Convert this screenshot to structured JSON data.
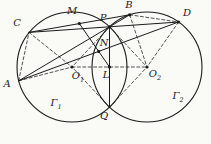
{
  "figure": {
    "colors": {
      "background": "#fafaf7",
      "ink": "#1b1b1b"
    },
    "circles": [
      {
        "id": "gamma1",
        "cx": 72,
        "cy": 67,
        "r": 55,
        "label": "Γ",
        "sub": "1",
        "label_x": 56,
        "label_y": 106
      },
      {
        "id": "gamma2",
        "cx": 147,
        "cy": 67,
        "r": 55,
        "label": "Γ",
        "sub": "2",
        "label_x": 178,
        "label_y": 99
      }
    ],
    "points": {
      "A": {
        "x": 18.7,
        "y": 80.8,
        "label": "A",
        "sub": "",
        "label_x": 7,
        "label_y": 87,
        "dot": false
      },
      "B": {
        "x": 129.7,
        "y": 14.8,
        "label": "B",
        "sub": "",
        "label_x": 129,
        "label_y": 8,
        "dot": true
      },
      "C": {
        "x": 29,
        "y": 32.4,
        "label": "C",
        "sub": "",
        "label_x": 17,
        "label_y": 26,
        "dot": false
      },
      "D": {
        "x": 178.6,
        "y": 22,
        "label": "D",
        "sub": "",
        "label_x": 187,
        "label_y": 16,
        "dot": true
      },
      "P": {
        "x": 109.5,
        "y": 26.8,
        "label": "P",
        "sub": "",
        "label_x": 103,
        "label_y": 21,
        "dot": true
      },
      "Q": {
        "x": 109.5,
        "y": 107.2,
        "label": "Q",
        "sub": "",
        "label_x": 104,
        "label_y": 119,
        "dot": false
      },
      "M": {
        "x": 79.35,
        "y": 23.6,
        "label": "M",
        "sub": "",
        "label_x": 72,
        "label_y": 14,
        "dot": true
      },
      "N": {
        "x": 98.65,
        "y": 51.4,
        "label": "N",
        "sub": "",
        "label_x": 104,
        "label_y": 46,
        "dot": true
      },
      "L": {
        "x": 109.5,
        "y": 67,
        "label": "L",
        "sub": "",
        "label_x": 106,
        "label_y": 78,
        "dot": true
      },
      "O1": {
        "x": 72,
        "y": 67,
        "label": "O",
        "sub": "1",
        "label_x": 78,
        "label_y": 79,
        "dot": true
      },
      "O2": {
        "x": 147,
        "y": 67,
        "label": "O",
        "sub": "2",
        "label_x": 155,
        "label_y": 77,
        "dot": true
      }
    },
    "segments_solid": [
      [
        "A",
        "B"
      ],
      [
        "C",
        "D"
      ],
      [
        "P",
        "Q"
      ],
      [
        "C",
        "B"
      ],
      [
        "A",
        "D"
      ],
      [
        "M",
        "L"
      ]
    ],
    "segments_dashed": [
      [
        "A",
        "C"
      ],
      [
        "B",
        "D"
      ],
      [
        "O1",
        "O2"
      ],
      [
        "P",
        "O1"
      ],
      [
        "P",
        "O2"
      ],
      [
        "Q",
        "O1"
      ],
      [
        "Q",
        "O2"
      ],
      [
        "A",
        "O1"
      ],
      [
        "C",
        "O1"
      ],
      [
        "B",
        "O2"
      ],
      [
        "D",
        "O2"
      ]
    ],
    "style": {
      "circle_width": 1.1,
      "solid_width": 1.0,
      "dashed_width": 0.75,
      "dash_pattern": "3 2.4",
      "dot_radius": 1.6,
      "label_size": 10,
      "sub_size": 6.5
    }
  }
}
